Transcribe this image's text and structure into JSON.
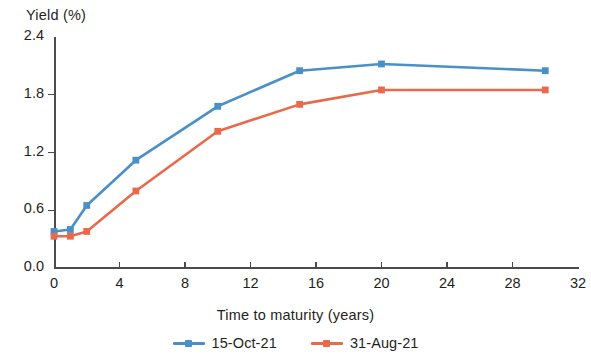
{
  "chart_data": {
    "type": "line",
    "title": "",
    "xlabel": "Time to maturity (years)",
    "ylabel": "Yield (%)",
    "xlim": [
      0,
      32
    ],
    "ylim": [
      0.0,
      2.4
    ],
    "xticks": [
      "0",
      "4",
      "8",
      "12",
      "16",
      "20",
      "24",
      "28",
      "32"
    ],
    "xtick_values": [
      0,
      4,
      8,
      12,
      16,
      20,
      24,
      28,
      32
    ],
    "yticks": [
      "0.0",
      "0.6",
      "1.2",
      "1.8",
      "2.4"
    ],
    "ytick_values": [
      0.0,
      0.6,
      1.2,
      1.8,
      2.4
    ],
    "grid": false,
    "legend_position": "bottom",
    "x": [
      0,
      1,
      2,
      5,
      10,
      15,
      20,
      30
    ],
    "series": [
      {
        "name": "15-Oct-21",
        "color": "#4a90c8",
        "marker": "square",
        "values": [
          0.38,
          0.4,
          0.65,
          1.12,
          1.68,
          2.05,
          2.12,
          2.05
        ]
      },
      {
        "name": "31-Aug-21",
        "color": "#e9694b",
        "marker": "square",
        "values": [
          0.33,
          0.33,
          0.38,
          0.8,
          1.42,
          1.7,
          1.85,
          1.85
        ]
      }
    ]
  },
  "axis": {
    "y_title": "Yield (%)",
    "x_title": "Time to maturity (years)"
  },
  "legend": {
    "items": [
      {
        "label": "15-Oct-21",
        "color": "#4a90c8"
      },
      {
        "label": "31-Aug-21",
        "color": "#e9694b"
      }
    ]
  }
}
